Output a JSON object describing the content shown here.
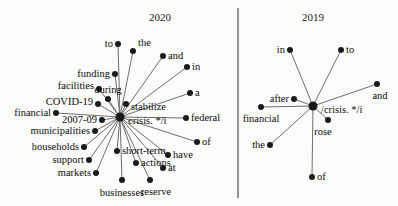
{
  "figure": {
    "width": 398,
    "height": 206,
    "background_color": "#fbfbfa",
    "node_color": "#1a1a1a",
    "edge_color": "#555555",
    "text_color": "#0d0d0d",
    "divider_color": "#3a3a3a"
  },
  "chart_data": {
    "type": "diagram",
    "subtype": "star-network-graph",
    "title": "",
    "panels": [
      {
        "id": "panel-2020",
        "title": "2020",
        "title_x": 160,
        "title_y": 17,
        "hub": {
          "label": "crisis. */i",
          "x": 120,
          "y": 117,
          "label_side": "right",
          "label_dx": 8,
          "label_dy": 3
        },
        "nodes": [
          {
            "label": "to",
            "x": 118,
            "y": 44,
            "side": "left",
            "dx": -5,
            "dy": 0
          },
          {
            "label": "the",
            "x": 133,
            "y": 51,
            "side": "right",
            "dx": 5,
            "dy": -8
          },
          {
            "label": "and",
            "x": 163,
            "y": 56,
            "side": "right",
            "dx": 5,
            "dy": 0
          },
          {
            "label": "in",
            "x": 187,
            "y": 67,
            "side": "right",
            "dx": 5,
            "dy": 0
          },
          {
            "label": "a",
            "x": 190,
            "y": 93,
            "side": "right",
            "dx": 5,
            "dy": 0
          },
          {
            "label": "federal",
            "x": 186,
            "y": 118,
            "side": "right",
            "dx": 5,
            "dy": 0
          },
          {
            "label": "of",
            "x": 197,
            "y": 142,
            "side": "right",
            "dx": 5,
            "dy": 0
          },
          {
            "label": "have",
            "x": 168,
            "y": 155,
            "side": "right",
            "dx": 5,
            "dy": 0
          },
          {
            "label": "at",
            "x": 163,
            "y": 168,
            "side": "right",
            "dx": 5,
            "dy": 0
          },
          {
            "label": "reserve",
            "x": 150,
            "y": 180,
            "side": "center",
            "dx": 6,
            "dy": 12
          },
          {
            "label": "businesses",
            "x": 122,
            "y": 180,
            "side": "center",
            "dx": 0,
            "dy": 13
          },
          {
            "label": "actions",
            "x": 136,
            "y": 163,
            "side": "right",
            "dx": 5,
            "dy": 0
          },
          {
            "label": "short-term",
            "x": 117,
            "y": 151,
            "side": "right",
            "dx": 5,
            "dy": 0
          },
          {
            "label": "markets",
            "x": 96,
            "y": 173,
            "side": "left",
            "dx": -5,
            "dy": 0
          },
          {
            "label": "support",
            "x": 89,
            "y": 160,
            "side": "left",
            "dx": -5,
            "dy": 0
          },
          {
            "label": "households",
            "x": 84,
            "y": 147,
            "side": "left",
            "dx": -5,
            "dy": 0
          },
          {
            "label": "municipalities",
            "x": 95,
            "y": 131,
            "side": "left",
            "dx": -5,
            "dy": 0
          },
          {
            "label": "2007-09",
            "x": 102,
            "y": 120,
            "side": "left",
            "dx": -5,
            "dy": 0
          },
          {
            "label": "financial",
            "x": 56,
            "y": 113,
            "side": "left",
            "dx": -5,
            "dy": 0
          },
          {
            "label": "COVID-19",
            "x": 98,
            "y": 104,
            "side": "left",
            "dx": -5,
            "dy": -2
          },
          {
            "label": "facilities",
            "x": 99,
            "y": 89,
            "side": "left",
            "dx": -5,
            "dy": -3
          },
          {
            "label": "during",
            "x": 108,
            "y": 99,
            "side": "center",
            "dx": 0,
            "dy": -9
          },
          {
            "label": "funding",
            "x": 115,
            "y": 74,
            "side": "left",
            "dx": -5,
            "dy": 0
          },
          {
            "label": "stabilize",
            "x": 126,
            "y": 104,
            "side": "right",
            "dx": 5,
            "dy": 3
          }
        ]
      },
      {
        "id": "panel-2019",
        "title": "2019",
        "title_x": 313,
        "title_y": 17,
        "hub": {
          "label": "/crisis. */i",
          "x": 313,
          "y": 106,
          "label_side": "right",
          "label_dx": 8,
          "label_dy": 3
        },
        "nodes": [
          {
            "label": "in",
            "x": 290,
            "y": 50,
            "side": "left",
            "dx": -5,
            "dy": 0
          },
          {
            "label": "to",
            "x": 341,
            "y": 50,
            "side": "right",
            "dx": 5,
            "dy": 0
          },
          {
            "label": "and",
            "x": 377,
            "y": 84,
            "side": "center",
            "dx": 3,
            "dy": 12
          },
          {
            "label": "after",
            "x": 294,
            "y": 99,
            "side": "left",
            "dx": -5,
            "dy": 0
          },
          {
            "label": "financial",
            "x": 261,
            "y": 107,
            "side": "center",
            "dx": 0,
            "dy": 12
          },
          {
            "label": "rose",
            "x": 328,
            "y": 120,
            "side": "center",
            "dx": -5,
            "dy": 12
          },
          {
            "label": "the",
            "x": 270,
            "y": 145,
            "side": "left",
            "dx": -5,
            "dy": 0
          },
          {
            "label": "of",
            "x": 312,
            "y": 177,
            "side": "right",
            "dx": 5,
            "dy": 0
          }
        ]
      }
    ],
    "divider": {
      "x": 238,
      "y1": 8,
      "y2": 198
    }
  }
}
